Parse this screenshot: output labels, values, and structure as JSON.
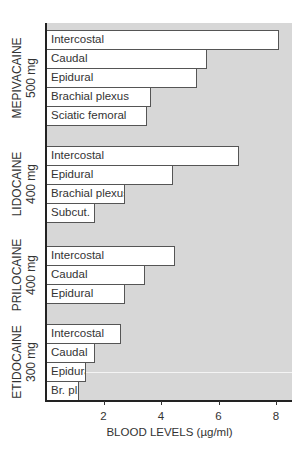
{
  "chart_data": {
    "type": "bar",
    "orientation": "horizontal",
    "title": "",
    "xlabel": "BLOOD LEVELS (µg/ml)",
    "ylabel": "",
    "xlim": [
      0,
      8.5
    ],
    "xticks": [
      2,
      4,
      6,
      8
    ],
    "grid": false,
    "legend": null,
    "groups": [
      {
        "drug": "MEPIVACAINE",
        "dose": "500 mg",
        "bars": [
          {
            "label": "Intercostal",
            "value": 8.1
          },
          {
            "label": "Caudal",
            "value": 5.6
          },
          {
            "label": "Epidural",
            "value": 5.25
          },
          {
            "label": "Brachial plexus",
            "value": 3.65
          },
          {
            "label": "Sciatic femoral",
            "value": 3.5
          }
        ]
      },
      {
        "drug": "LIDOCAINE",
        "dose": "400 mg",
        "bars": [
          {
            "label": "Intercostal",
            "value": 6.7
          },
          {
            "label": "Epidural",
            "value": 4.4
          },
          {
            "label": "Brachial plexus",
            "value": 2.75
          },
          {
            "label": "Subcut.",
            "value": 1.7
          }
        ]
      },
      {
        "drug": "PRILOCAINE",
        "dose": "400 mg",
        "bars": [
          {
            "label": "Intercostal",
            "value": 4.5
          },
          {
            "label": "Caudal",
            "value": 3.45
          },
          {
            "label": "Epidural",
            "value": 2.75
          }
        ]
      },
      {
        "drug": "ETIDOCAINE",
        "dose": "300 mg",
        "bars": [
          {
            "label": "Intercostal",
            "value": 2.6
          },
          {
            "label": "Caudal",
            "value": 1.7
          },
          {
            "label": "Epidural",
            "value": 1.4
          },
          {
            "label": "Br. pl.",
            "value": 1.15
          }
        ]
      }
    ]
  },
  "colors": {
    "plot_background": "#d7d7d7",
    "bar_fill": "#ffffff",
    "bar_border": "#555555",
    "axis": "#222222"
  }
}
